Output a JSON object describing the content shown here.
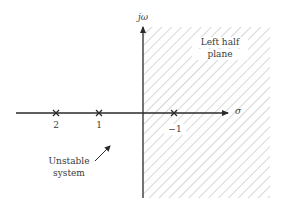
{
  "diagram": {
    "type": "s-plane pole plot",
    "axes": {
      "vertical_label": "jω",
      "horizontal_label": "σ"
    },
    "region": {
      "label_line1": "Left half",
      "label_line2": "plane",
      "fill": "diagonal hatch",
      "hatch_color": "#b5b5b5"
    },
    "poles": [
      {
        "label": "2",
        "marker": "x"
      },
      {
        "label": "1",
        "marker": "x"
      },
      {
        "label": "−1",
        "marker": "x"
      }
    ],
    "annotation": {
      "line1": "Unstable",
      "line2": "system"
    },
    "colors": {
      "axis": "#2a2a2a",
      "text": "#3a3a3a"
    }
  }
}
